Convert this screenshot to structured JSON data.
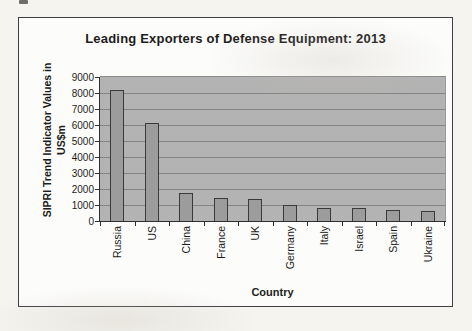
{
  "chart": {
    "title": "Leading Exporters of Defense Equipment: 2013",
    "y_axis_title_line1": "SIPRI Trend Indicator Values in",
    "y_axis_title_line2": "US$m",
    "x_axis_title": "Country"
  },
  "chart_data": {
    "type": "bar",
    "title": "Leading Exporters of Defense Equipment: 2013",
    "categories": [
      "Russia",
      "US",
      "China",
      "France",
      "UK",
      "Germany",
      "Italy",
      "Israel",
      "Spain",
      "Ukraine"
    ],
    "values": [
      8200,
      6150,
      1750,
      1450,
      1350,
      975,
      825,
      800,
      700,
      650
    ],
    "xlabel": "Country",
    "ylabel": "SIPRI Trend Indicator Values in US$m",
    "ylim": [
      0,
      9000
    ],
    "yticks": [
      9000,
      8000,
      7000,
      6000,
      5000,
      4000,
      3000,
      2000,
      1000,
      0
    ],
    "grid": true,
    "legend": "none",
    "plot_bg_color": "#b3b3b3",
    "bar_color": "#9c9c9c",
    "bar_border_color": "#3a3a3a"
  }
}
